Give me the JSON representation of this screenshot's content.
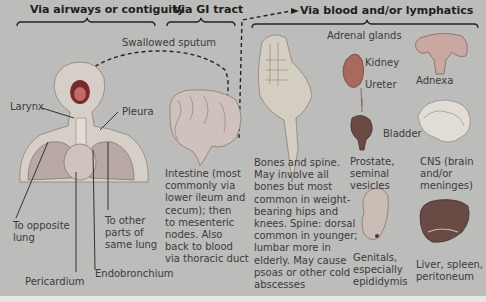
{
  "headers": {
    "airways": "Via airways or contiguity",
    "gi": "Via GI tract",
    "blood": "Via blood and/or lymphatics"
  },
  "labels": {
    "swallowed_sputum": "Swallowed sputum",
    "larynx": "Larynx",
    "pleura": "Pleura",
    "to_opposite_lung": "To opposite\nlung",
    "to_other_parts": "To other\nparts of\nsame lung",
    "pericardium": "Pericardium",
    "endobronchium": "Endobronchium",
    "intestine": "Intestine (most\ncommonly via\nlower ileum and\ncecum); then\nto mesenteric\nnodes. Also\nback to blood\nvia thoracic duct",
    "bones": "Bones and spine.\nMay involve all\nbones but most\ncommon in weight-\nbearing hips and\nknees. Spine: dorsal\ncommon in younger;\nlumbar more in\nelderly. May cause\npsoas or other cold\nabscesses",
    "adrenal_glands": "Adrenal glands",
    "kidney": "Kidney",
    "ureter": "Ureter",
    "bladder": "Bladder",
    "prostate": "Prostate,\nseminal\nvesicles",
    "adnexa": "Adnexa",
    "cns": "CNS (brain\nand/or\nmeninges)",
    "genitals": "Genitals,\nespecially\nepididymis",
    "liver": "Liver, spleen,\nperitoneum"
  },
  "illustrations": [
    "head-and-thorax",
    "intestine",
    "spine-and-pelvis",
    "kidney-ureter-bladder",
    "uterus-adnexa",
    "brain",
    "testis",
    "liver-spleen"
  ]
}
